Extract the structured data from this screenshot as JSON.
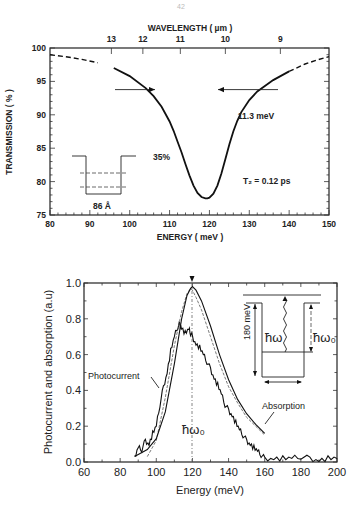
{
  "page_number": "42",
  "chart_data": [
    {
      "type": "line",
      "title": "",
      "xlabel": "ENERGY ( meV )",
      "ylabel": "TRANSMISSION ( % )",
      "top_xlabel": "WAVELENGTH ( µm )",
      "xlim": [
        80,
        150
      ],
      "ylim": [
        75,
        100
      ],
      "x_ticks": [
        80,
        90,
        100,
        110,
        120,
        130,
        140,
        150
      ],
      "y_ticks": [
        75,
        80,
        85,
        90,
        95,
        100
      ],
      "top_ticks": [
        {
          "label": "13",
          "energy": 95.4
        },
        {
          "label": "12",
          "energy": 103.3
        },
        {
          "label": "11",
          "energy": 112.7
        },
        {
          "label": "10",
          "energy": 124.0
        },
        {
          "label": "9",
          "energy": 137.8
        }
      ],
      "grid": false,
      "series": [
        {
          "name": "transmission",
          "x": [
            80,
            84,
            88,
            92,
            96,
            100,
            104,
            106,
            108,
            110,
            111,
            112,
            113,
            114,
            115,
            116,
            117,
            118,
            119,
            119.5,
            120,
            121,
            122,
            123,
            124,
            125,
            126,
            127,
            128,
            130,
            132,
            136,
            140,
            144,
            147,
            150
          ],
          "y": [
            99.0,
            98.7,
            98.3,
            97.8,
            97.0,
            95.8,
            94.0,
            92.8,
            91.2,
            89.0,
            87.6,
            86.0,
            84.4,
            82.6,
            80.9,
            79.4,
            78.3,
            77.7,
            77.5,
            77.5,
            77.6,
            78.2,
            79.4,
            81.2,
            83.4,
            85.6,
            87.5,
            89.1,
            90.4,
            92.2,
            93.5,
            95.2,
            96.5,
            97.6,
            98.2,
            98.7
          ],
          "dashed_below": 94,
          "dashed_above": 140
        }
      ],
      "annotations": [
        {
          "text": "11.3 meV",
          "type": "fwhm_arrows",
          "y": 89,
          "x_left": 113.5,
          "x_right": 124.8
        },
        {
          "text": "35%",
          "type": "label"
        },
        {
          "text": "86 Å",
          "type": "well_width"
        },
        {
          "text": "T₂ = 0.12 ps",
          "type": "label"
        }
      ]
    },
    {
      "type": "line",
      "title": "",
      "xlabel": "Energy  (meV)",
      "ylabel": "Photocurrent and absorption  (a.u)",
      "xlim": [
        60,
        200
      ],
      "ylim": [
        0.0,
        1.0
      ],
      "x_ticks": [
        60,
        80,
        100,
        120,
        140,
        160,
        180,
        200
      ],
      "y_ticks": [
        0.0,
        0.2,
        0.4,
        0.6,
        0.8,
        1.0
      ],
      "grid": false,
      "series": [
        {
          "name": "Photocurrent",
          "x": [
            88,
            90,
            92,
            94,
            96,
            98,
            100,
            102,
            104,
            106,
            108,
            110,
            112,
            113,
            114,
            116,
            118,
            119,
            120,
            122,
            124,
            126,
            128,
            130,
            132,
            134,
            136,
            138,
            140,
            142,
            144,
            146,
            148,
            150,
            152,
            154,
            156,
            158,
            160,
            165,
            170,
            175,
            180,
            185,
            190,
            195,
            200
          ],
          "y": [
            0.02,
            0.08,
            0.07,
            0.12,
            0.1,
            0.16,
            0.2,
            0.32,
            0.42,
            0.5,
            0.62,
            0.7,
            0.76,
            0.77,
            0.75,
            0.72,
            0.74,
            0.72,
            0.7,
            0.66,
            0.64,
            0.6,
            0.56,
            0.52,
            0.47,
            0.43,
            0.38,
            0.32,
            0.29,
            0.26,
            0.22,
            0.18,
            0.15,
            0.12,
            0.1,
            0.08,
            0.06,
            0.04,
            0.02,
            0.02,
            0.02,
            0.02,
            0.03,
            0.02,
            0.01,
            0.02,
            0.02
          ]
        },
        {
          "name": "Absorption",
          "x": [
            95,
            100,
            105,
            110,
            114,
            117,
            119,
            120,
            122,
            125,
            130,
            135,
            140,
            145,
            150,
            155,
            160
          ],
          "y": [
            0.03,
            0.12,
            0.36,
            0.65,
            0.84,
            0.94,
            0.97,
            0.96,
            0.92,
            0.85,
            0.7,
            0.55,
            0.42,
            0.33,
            0.25,
            0.2,
            0.15
          ]
        },
        {
          "name": "Lorentzian fit",
          "x": [
            88,
            95,
            100,
            105,
            110,
            114,
            117,
            119,
            120,
            122,
            125,
            130,
            135,
            140,
            145,
            150,
            155,
            160
          ],
          "y": [
            0.03,
            0.07,
            0.13,
            0.28,
            0.55,
            0.8,
            0.93,
            0.97,
            0.98,
            0.96,
            0.9,
            0.76,
            0.6,
            0.46,
            0.35,
            0.27,
            0.21,
            0.16
          ]
        }
      ],
      "annotations": [
        {
          "text": "Photocurrent",
          "type": "series_label"
        },
        {
          "text": "Absorption",
          "type": "series_label"
        },
        {
          "text": "ħω₀",
          "type": "marker",
          "x": 120
        },
        {
          "text": "ħω",
          "type": "inset_label"
        },
        {
          "text": "ħω₀",
          "type": "inset_label"
        },
        {
          "text": "180 meV",
          "type": "inset_label"
        }
      ]
    }
  ]
}
